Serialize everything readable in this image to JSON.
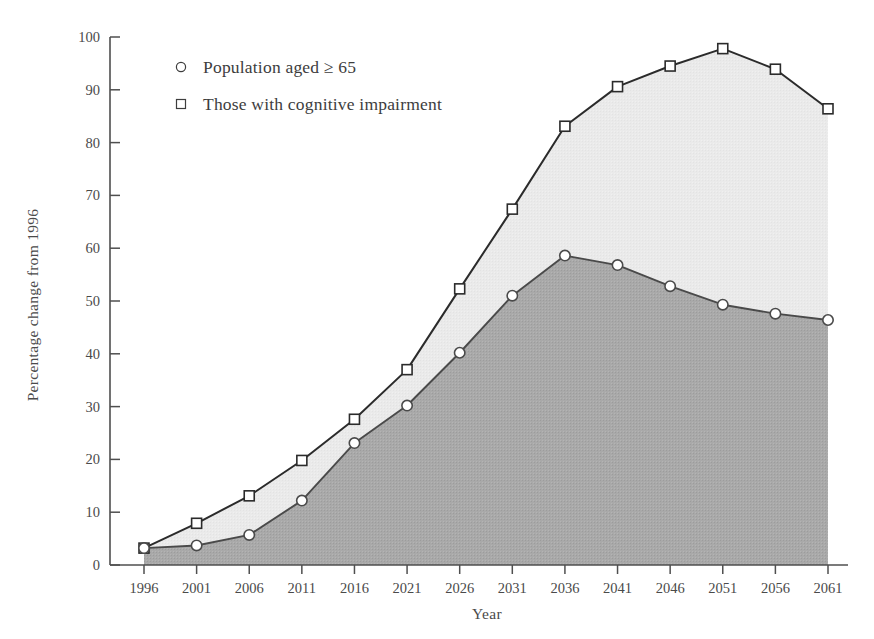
{
  "chart_data": {
    "type": "line",
    "title": "",
    "xlabel": "Year",
    "ylabel": "Percentage change from 1996",
    "x": [
      1996,
      2001,
      2006,
      2011,
      2016,
      2021,
      2026,
      2031,
      2036,
      2041,
      2046,
      2051,
      2056,
      2061
    ],
    "xticklabels": [
      "1996",
      "2001",
      "2006",
      "2011",
      "2016",
      "2021",
      "2026",
      "2031",
      "2036",
      "2041",
      "2046",
      "2051",
      "2056",
      "2061"
    ],
    "yticklabels": [
      "0",
      "10",
      "20",
      "30",
      "40",
      "50",
      "60",
      "70",
      "80",
      "90",
      "100"
    ],
    "yticks": [
      0,
      10,
      20,
      30,
      40,
      50,
      60,
      70,
      80,
      90,
      100
    ],
    "ylim": [
      0,
      100
    ],
    "xlim": [
      1996,
      2061
    ],
    "grid": false,
    "legend_position": "upper-left-inside",
    "series": [
      {
        "name": "Population aged ≥ 65",
        "marker": "circle",
        "fill_color": "#a8a8a8",
        "line_color": "#4a4a4a",
        "values": [
          3.2,
          3.7,
          5.7,
          12.2,
          23.1,
          30.2,
          40.2,
          51.0,
          58.6,
          56.8,
          52.8,
          49.3,
          47.6,
          46.4
        ]
      },
      {
        "name": "Those with cognitive impairment",
        "marker": "square",
        "fill_color": "#e9e9e9",
        "line_color": "#2b2b2b",
        "values": [
          3.2,
          7.9,
          13.1,
          19.8,
          27.6,
          37.0,
          52.3,
          67.4,
          83.1,
          90.6,
          94.5,
          97.8,
          93.9,
          86.4
        ]
      }
    ]
  },
  "legend": {
    "items": [
      {
        "marker": "circle",
        "label": "Population aged ≥ 65"
      },
      {
        "marker": "square",
        "label": "Those with cognitive impairment"
      }
    ]
  },
  "axes": {
    "x_title": "Year",
    "y_title": "Percentage change from 1996"
  },
  "colors": {
    "dark_fill": "#a8a8a8",
    "light_fill": "#e9e9e9",
    "axis": "#4f4f4f",
    "text": "#4a4a4a",
    "upper_line": "#2b2b2b",
    "lower_line": "#4a4a4a"
  }
}
